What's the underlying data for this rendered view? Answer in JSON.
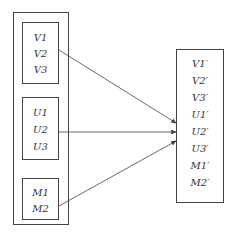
{
  "diagram": {
    "left_groups": [
      {
        "name": "V",
        "items": [
          "V1",
          "V2",
          "V3"
        ]
      },
      {
        "name": "U",
        "items": [
          "U1",
          "U2",
          "U3"
        ]
      },
      {
        "name": "M",
        "items": [
          "M1",
          "M2"
        ]
      }
    ],
    "right_box": {
      "items": [
        "V1′",
        "V2′",
        "V3′",
        "U1′",
        "U2′",
        "U3′",
        "M1′",
        "M2′"
      ]
    },
    "arrows": [
      {
        "from": "V",
        "to": "right_box"
      },
      {
        "from": "U",
        "to": "right_box"
      },
      {
        "from": "M",
        "to": "right_box"
      }
    ],
    "line_color": "#444444"
  }
}
